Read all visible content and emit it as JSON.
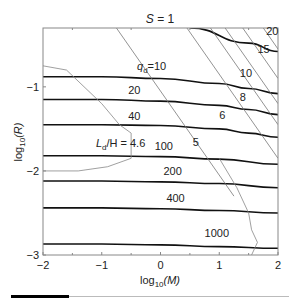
{
  "chart_data": {
    "type": "line",
    "title": "S = 1",
    "xlabel": "log10(M)",
    "ylabel": "log10(R)",
    "xlim": [
      -2,
      2
    ],
    "ylim": [
      -3,
      -0.3
    ],
    "xticks": [
      "-2",
      "-1",
      "0",
      "1",
      "2"
    ],
    "yticks": [
      "-1",
      "-2",
      "-3"
    ],
    "grid": false,
    "legend": null,
    "series": [
      {
        "name": "q_d = 10",
        "family": "q_d",
        "style": "thick-black",
        "x": [
          -2,
          -1,
          0,
          1,
          1.5,
          2
        ],
        "y": [
          -0.88,
          -0.88,
          -0.9,
          -0.96,
          -1.02,
          -1.08
        ]
      },
      {
        "name": "q_d = 20",
        "family": "q_d",
        "style": "thick-black",
        "x": [
          -2,
          -1,
          0,
          1,
          1.5,
          2
        ],
        "y": [
          -1.15,
          -1.15,
          -1.17,
          -1.22,
          -1.27,
          -1.33
        ]
      },
      {
        "name": "q_d = 40",
        "family": "q_d",
        "style": "thick-black",
        "x": [
          -2,
          -1,
          0,
          1,
          1.5,
          2
        ],
        "y": [
          -1.45,
          -1.45,
          -1.46,
          -1.5,
          -1.55,
          -1.6
        ]
      },
      {
        "name": "q_d = 100",
        "family": "q_d",
        "style": "thick-black",
        "x": [
          -2,
          -1,
          0,
          1,
          2
        ],
        "y": [
          -1.82,
          -1.82,
          -1.83,
          -1.86,
          -1.92
        ]
      },
      {
        "name": "q_d = 200",
        "family": "q_d",
        "style": "thick-black",
        "x": [
          -2,
          -1,
          0,
          1,
          2
        ],
        "y": [
          -2.12,
          -2.12,
          -2.13,
          -2.15,
          -2.2
        ]
      },
      {
        "name": "q_d = 400",
        "family": "q_d",
        "style": "thick-black",
        "x": [
          -2,
          -1,
          0,
          1,
          2
        ],
        "y": [
          -2.44,
          -2.44,
          -2.45,
          -2.47,
          -2.5
        ]
      },
      {
        "name": "q_d = 1000",
        "family": "q_d",
        "style": "thick-black",
        "x": [
          -2,
          -1,
          0,
          1,
          2
        ],
        "y": [
          -2.87,
          -2.87,
          -2.88,
          -2.9,
          -2.92
        ]
      },
      {
        "name": "q_d = 20 (upper)",
        "family": "q_d",
        "style": "thick-black",
        "x": [
          0.5,
          1.5,
          2
        ],
        "y": [
          -0.3,
          -0.48,
          -0.58
        ]
      },
      {
        "name": "5",
        "family": "diagonal",
        "style": "thin-gray",
        "x": [
          -0.75,
          1.25
        ],
        "y": [
          -0.3,
          -2.3
        ]
      },
      {
        "name": "6",
        "family": "diagonal",
        "style": "thin-gray",
        "x": [
          0.45,
          2
        ],
        "y": [
          -0.3,
          -1.85
        ]
      },
      {
        "name": "8",
        "family": "diagonal",
        "style": "thin-gray",
        "x": [
          0.85,
          2
        ],
        "y": [
          -0.3,
          -1.45
        ]
      },
      {
        "name": "10",
        "family": "diagonal",
        "style": "thin-gray",
        "x": [
          1.1,
          2
        ],
        "y": [
          -0.3,
          -1.2
        ]
      },
      {
        "name": "15",
        "family": "diagonal",
        "style": "thin-gray",
        "x": [
          1.4,
          2
        ],
        "y": [
          -0.3,
          -0.9
        ]
      },
      {
        "name": "20",
        "family": "diagonal",
        "style": "thin-gray",
        "x": [
          1.75,
          2
        ],
        "y": [
          -0.3,
          -0.55
        ]
      },
      {
        "name": "L_d/H = 4.6",
        "family": "boundary",
        "style": "thin-gray-jagged",
        "x": [
          -2,
          -1.6,
          -1.0,
          -0.7,
          -0.5,
          -0.5,
          -0.9,
          -1.4,
          -2
        ],
        "y": [
          -0.75,
          -0.8,
          -1.2,
          -1.45,
          -1.55,
          -1.85,
          -1.95,
          -2.0,
          -2.0
        ]
      },
      {
        "name": "boundary right",
        "family": "boundary",
        "style": "thin-gray-jagged",
        "x": [
          1.0,
          1.3,
          1.5,
          1.55,
          1.65,
          1.55
        ],
        "y": [
          -1.85,
          -2.2,
          -2.5,
          -2.7,
          -2.85,
          -3.0
        ]
      }
    ],
    "annotations": [
      {
        "text": "q_d=10",
        "x": -0.4,
        "y": -0.8
      },
      {
        "text": "20",
        "x": -0.55,
        "y": -1.08
      },
      {
        "text": "40",
        "x": -0.55,
        "y": -1.4
      },
      {
        "text": "100",
        "x": -0.1,
        "y": -1.75
      },
      {
        "text": "200",
        "x": 0.05,
        "y": -2.05
      },
      {
        "text": "400",
        "x": 0.1,
        "y": -2.37
      },
      {
        "text": "1000",
        "x": 0.75,
        "y": -2.78
      },
      {
        "text": "L_d/H = 4.6",
        "x": -1.1,
        "y": -1.72
      },
      {
        "text": "5",
        "x": 0.55,
        "y": -1.7
      },
      {
        "text": "6",
        "x": 1.0,
        "y": -1.38
      },
      {
        "text": "8",
        "x": 1.35,
        "y": -1.17
      },
      {
        "text": "10",
        "x": 1.35,
        "y": -0.88
      },
      {
        "text": "15",
        "x": 1.65,
        "y": -0.6
      },
      {
        "text": "20",
        "x": 1.8,
        "y": -0.38
      }
    ]
  },
  "labels": {
    "title": "S = 1",
    "xlabel_main": "log",
    "xlabel_sub": "10",
    "xlabel_arg": "(M)",
    "ylabel_main": "log",
    "ylabel_sub": "10",
    "ylabel_arg": "(R)",
    "qd_label_q": "q",
    "qd_label_sub": "d",
    "qd_label_val": "=10",
    "ld_label_L": "L",
    "ld_label_sub": "d",
    "ld_label_rest": "/H = 4.6"
  }
}
